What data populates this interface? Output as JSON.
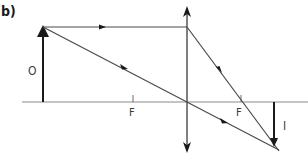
{
  "figure": {
    "panel_label": "b)",
    "object_label": "O",
    "image_label": "I",
    "focal_left_label": "F",
    "focal_right_label": "F"
  },
  "colors": {
    "line": "#4a4a4a",
    "axis": "#8a8a8a",
    "arrow": "#1a1a1a",
    "background": "#ffffff"
  }
}
